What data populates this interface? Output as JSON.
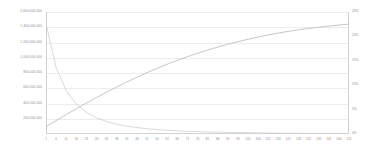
{
  "chart_data": {
    "type": "line",
    "title": "",
    "subtitle": "",
    "xlabel": "",
    "ylabel": "",
    "grid": true,
    "legend": "none",
    "x_ticks": [
      1,
      6,
      11,
      16,
      21,
      26,
      31,
      36,
      41,
      46,
      51,
      56,
      61,
      66,
      71,
      76,
      81,
      86,
      91,
      96,
      101,
      106,
      111,
      116,
      121,
      126,
      131,
      136,
      141,
      146,
      151
    ],
    "xlim": [
      1,
      151
    ],
    "y_left_ticks": [
      "1,600,000,000",
      "1,400,000,000",
      "1,200,000,000",
      "1,000,000,000",
      "800,000,000",
      "600,000,000",
      "400,000,000",
      "200,000,000"
    ],
    "y_left_values": [
      1600000000,
      1400000000,
      1200000000,
      1000000000,
      800000000,
      600000000,
      400000000,
      200000000
    ],
    "ylim_left": [
      0,
      1600000000
    ],
    "y_right_ticks": [
      "25%",
      "20%",
      "15%",
      "10%",
      "5%",
      "0%"
    ],
    "y_right_values": [
      25,
      20,
      15,
      10,
      5,
      0
    ],
    "ylim_right": [
      0,
      25
    ],
    "series": [
      {
        "name": "cumulative",
        "axis": "left",
        "color": "#b9b9b9",
        "x": [
          1,
          6,
          11,
          16,
          21,
          26,
          31,
          36,
          41,
          46,
          51,
          56,
          61,
          66,
          71,
          76,
          81,
          86,
          91,
          96,
          101,
          106,
          111,
          116,
          121,
          126,
          131,
          136,
          141,
          146,
          151
        ],
        "values": [
          95000000,
          175000000,
          255000000,
          330000000,
          405000000,
          478000000,
          548000000,
          616000000,
          681000000,
          744000000,
          804000000,
          861000000,
          915000000,
          966000000,
          1014000000,
          1059000000,
          1101000000,
          1140000000,
          1177000000,
          1211000000,
          1243000000,
          1272000000,
          1299000000,
          1324000000,
          1346000000,
          1366000000,
          1384000000,
          1400000000,
          1415000000,
          1429000000,
          1441000000
        ]
      },
      {
        "name": "decay",
        "axis": "left",
        "color": "#cfcfcf",
        "x": [
          1,
          6,
          11,
          16,
          21,
          26,
          31,
          36,
          41,
          46,
          51,
          56,
          61,
          66,
          71,
          76,
          81,
          86,
          91,
          96,
          101,
          106,
          111,
          116,
          121,
          126,
          131,
          136,
          141,
          146,
          151
        ],
        "values": [
          1448000000,
          870000000,
          568000000,
          392000000,
          283000000,
          212000000,
          163000000,
          128000000,
          103000000,
          84000000,
          69000000,
          58000000,
          49000000,
          42000000,
          36000000,
          31000000,
          27000000,
          24000000,
          21000000,
          18500000,
          16500000,
          14500000,
          13000000,
          11500000,
          10000000,
          9000000,
          8000000,
          7000000,
          6500000,
          5800000,
          5200000
        ]
      }
    ]
  }
}
